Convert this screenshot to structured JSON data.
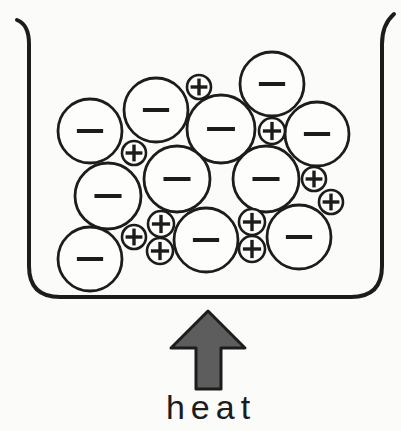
{
  "labels": {
    "heat": "heat"
  },
  "colors": {
    "ink": "#1c1c1c",
    "background": "#fbfbfa",
    "particle_fill": "#fdfdfc",
    "arrow_fill": "#5d5d5d"
  },
  "diagram": {
    "type": "particle-model",
    "container": "beaker",
    "anion_sign": "-",
    "cation_sign": "+",
    "ions": [
      {
        "sign": "-",
        "x": 90,
        "y": 131,
        "r": 32
      },
      {
        "sign": "-",
        "x": 156,
        "y": 110,
        "r": 32
      },
      {
        "sign": "-",
        "x": 272,
        "y": 84,
        "r": 32
      },
      {
        "sign": "-",
        "x": 221,
        "y": 129,
        "r": 34
      },
      {
        "sign": "-",
        "x": 317,
        "y": 134,
        "r": 32
      },
      {
        "sign": "-",
        "x": 108,
        "y": 196,
        "r": 33
      },
      {
        "sign": "-",
        "x": 177,
        "y": 179,
        "r": 33
      },
      {
        "sign": "-",
        "x": 266,
        "y": 179,
        "r": 33
      },
      {
        "sign": "-",
        "x": 90,
        "y": 259,
        "r": 32
      },
      {
        "sign": "-",
        "x": 206,
        "y": 240,
        "r": 32
      },
      {
        "sign": "-",
        "x": 299,
        "y": 237,
        "r": 32
      },
      {
        "sign": "+",
        "x": 199,
        "y": 87,
        "r": 12
      },
      {
        "sign": "+",
        "x": 272,
        "y": 131,
        "r": 13
      },
      {
        "sign": "+",
        "x": 134,
        "y": 153,
        "r": 12
      },
      {
        "sign": "+",
        "x": 314,
        "y": 179,
        "r": 12
      },
      {
        "sign": "+",
        "x": 331,
        "y": 202,
        "r": 12
      },
      {
        "sign": "+",
        "x": 134,
        "y": 237,
        "r": 12
      },
      {
        "sign": "+",
        "x": 161,
        "y": 224,
        "r": 13
      },
      {
        "sign": "+",
        "x": 160,
        "y": 251,
        "r": 13
      },
      {
        "sign": "+",
        "x": 252,
        "y": 222,
        "r": 13
      },
      {
        "sign": "+",
        "x": 252,
        "y": 249,
        "r": 13
      }
    ]
  }
}
